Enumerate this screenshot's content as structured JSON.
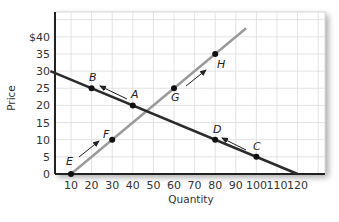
{
  "chart_data": {
    "type": "line",
    "title": "",
    "xlabel": "Quantity",
    "ylabel": "Price",
    "xlim": [
      0,
      130
    ],
    "ylim": [
      0,
      47
    ],
    "x_ticks": [
      10,
      20,
      30,
      40,
      50,
      60,
      70,
      80,
      90,
      100,
      110,
      120
    ],
    "x_tick_labels": [
      "10",
      "20",
      "30",
      "40",
      "50",
      "60",
      "70",
      "80",
      "90",
      "100",
      "110",
      "120"
    ],
    "y_ticks": [
      0,
      5,
      10,
      15,
      20,
      25,
      30,
      35,
      40
    ],
    "y_tick_labels": [
      "0",
      "5",
      "10",
      "15",
      "20",
      "25",
      "30",
      "35",
      "$40"
    ],
    "grid": true,
    "legend": null,
    "series": [
      {
        "name": "Demand",
        "color": "#2b2b2b",
        "line": [
          [
            0,
            30
          ],
          [
            120,
            0
          ]
        ],
        "points": [
          {
            "label": "B",
            "x": 20,
            "y": 25
          },
          {
            "label": "A",
            "x": 40,
            "y": 20
          },
          {
            "label": "D",
            "x": 80,
            "y": 10
          },
          {
            "label": "C",
            "x": 100,
            "y": 5
          }
        ]
      },
      {
        "name": "Supply",
        "color": "#9a9a9a",
        "line": [
          [
            10,
            0
          ],
          [
            95,
            42.5
          ]
        ],
        "points": [
          {
            "label": "E",
            "x": 10,
            "y": 0
          },
          {
            "label": "F",
            "x": 30,
            "y": 10
          },
          {
            "label": "G",
            "x": 60,
            "y": 25
          },
          {
            "label": "H",
            "x": 80,
            "y": 35
          }
        ]
      }
    ],
    "annotations": [
      {
        "type": "arrow",
        "from": "A",
        "to": "B",
        "description": "movement along demand from A toward B"
      },
      {
        "type": "arrow",
        "from": "C",
        "to": "D",
        "description": "movement along demand from C toward D"
      },
      {
        "type": "arrow",
        "from": "E",
        "to": "F",
        "description": "movement along supply from E toward F"
      },
      {
        "type": "arrow",
        "from": "G",
        "to": "H",
        "description": "movement along supply from G toward H"
      }
    ]
  },
  "labels": {
    "xlabel": "Quantity",
    "ylabel": "Price",
    "points": {
      "A": "A",
      "B": "B",
      "C": "C",
      "D": "D",
      "E": "E",
      "F": "F",
      "G": "G",
      "H": "H"
    }
  },
  "colors": {
    "demand": "#2b2b2b",
    "supply": "#9a9a9a",
    "grid": "#dcdcdc",
    "axis": "#222222"
  }
}
